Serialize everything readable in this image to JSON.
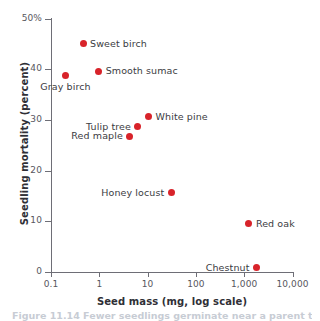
{
  "chart_data": {
    "type": "scatter",
    "title": "",
    "xlabel": "Seed mass (mg, log scale)",
    "ylabel": "Seedling mortality (percent)",
    "xscale": "log",
    "xlim": [
      0.1,
      10000
    ],
    "ylim": [
      0,
      50
    ],
    "grid": false,
    "legend": "none",
    "point_color": "#d8232a",
    "xticks": [
      {
        "value": 0.1,
        "label": "0.1"
      },
      {
        "value": 1,
        "label": "1"
      },
      {
        "value": 10,
        "label": "10"
      },
      {
        "value": 100,
        "label": "100"
      },
      {
        "value": 1000,
        "label": "1,000"
      },
      {
        "value": 10000,
        "label": "10,000"
      }
    ],
    "yticks": [
      {
        "value": 0,
        "label": "0"
      },
      {
        "value": 10,
        "label": "10"
      },
      {
        "value": 20,
        "label": "20"
      },
      {
        "value": 30,
        "label": "30"
      },
      {
        "value": 40,
        "label": "40"
      },
      {
        "value": 50,
        "label": "50%"
      }
    ],
    "points": [
      {
        "label": "Sweet birch",
        "x": 0.46,
        "y": 45.0,
        "label_pos": "right"
      },
      {
        "label": "Gray birch",
        "x": 0.2,
        "y": 38.7,
        "label_pos": "below"
      },
      {
        "label": "Smooth sumac",
        "x": 0.97,
        "y": 39.6,
        "label_pos": "right"
      },
      {
        "label": "White pine",
        "x": 10.5,
        "y": 30.6,
        "label_pos": "right"
      },
      {
        "label": "Tulip tree",
        "x": 6.3,
        "y": 28.6,
        "label_pos": "left"
      },
      {
        "label": "Red maple",
        "x": 4.3,
        "y": 26.8,
        "label_pos": "left"
      },
      {
        "label": "Honey locust",
        "x": 31.0,
        "y": 15.6,
        "label_pos": "left"
      },
      {
        "label": "Red oak",
        "x": 1250,
        "y": 9.5,
        "label_pos": "right"
      },
      {
        "label": "Chestnut",
        "x": 1800,
        "y": 0.8,
        "label_pos": "left"
      }
    ]
  },
  "caption": {
    "text": "Figure 11.14  Fewer seedlings germinate near a parent tree."
  }
}
